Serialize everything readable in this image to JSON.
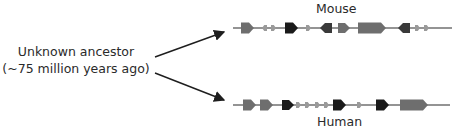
{
  "ancestor": {
    "line1": "Unknown ancestor",
    "line2": "(~75 million years ago)"
  },
  "species": [
    {
      "name": "Mouse",
      "genes": [
        {
          "shade": "gray",
          "dir": "right",
          "size": "medium"
        },
        {
          "shade": "light",
          "dir": "left",
          "size": "tiny"
        },
        {
          "shade": "light",
          "dir": "right",
          "size": "tiny"
        },
        {
          "shade": "black",
          "dir": "right",
          "size": "medium"
        },
        {
          "shade": "light",
          "dir": "right",
          "size": "tiny"
        },
        {
          "shade": "dark",
          "dir": "left",
          "size": "small"
        },
        {
          "shade": "gray",
          "dir": "right",
          "size": "small"
        },
        {
          "shade": "gray",
          "dir": "right",
          "size": "large"
        },
        {
          "shade": "dark",
          "dir": "left",
          "size": "small"
        },
        {
          "shade": "light",
          "dir": "right",
          "size": "tiny"
        },
        {
          "shade": "light",
          "dir": "right",
          "size": "tiny"
        }
      ]
    },
    {
      "name": "Human",
      "genes": [
        {
          "shade": "gray",
          "dir": "right",
          "size": "medium"
        },
        {
          "shade": "gray",
          "dir": "right",
          "size": "medium"
        },
        {
          "shade": "black",
          "dir": "right",
          "size": "small"
        },
        {
          "shade": "light",
          "dir": "right",
          "size": "tiny"
        },
        {
          "shade": "light",
          "dir": "right",
          "size": "tiny"
        },
        {
          "shade": "light",
          "dir": "right",
          "size": "tiny"
        },
        {
          "shade": "light",
          "dir": "right",
          "size": "tiny"
        },
        {
          "shade": "black",
          "dir": "right",
          "size": "medium"
        },
        {
          "shade": "light",
          "dir": "right",
          "size": "tiny"
        },
        {
          "shade": "black",
          "dir": "right",
          "size": "medium"
        },
        {
          "shade": "gray",
          "dir": "right",
          "size": "large"
        }
      ]
    }
  ],
  "colors": {
    "black": "#1a1a1a",
    "dark": "#3a3a3a",
    "gray": "#6e6e6e",
    "light": "#9a9a9a",
    "line": "#2a2a2a",
    "arrow": "#1e1e1e"
  }
}
